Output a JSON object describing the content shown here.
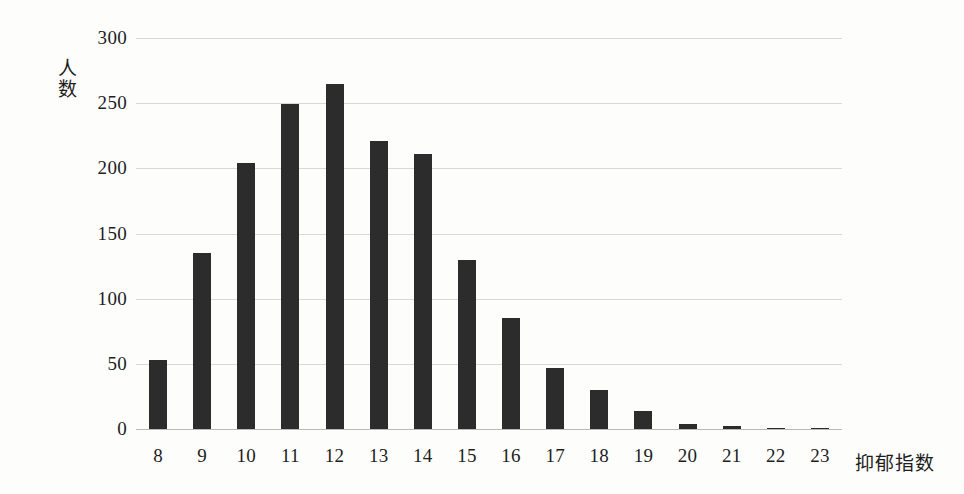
{
  "chart_data": {
    "type": "bar",
    "title": "",
    "subtitle": "",
    "xlabel": "抑郁指数",
    "ylabel": "人数",
    "categories": [
      "8",
      "9",
      "10",
      "11",
      "12",
      "13",
      "14",
      "15",
      "16",
      "17",
      "18",
      "19",
      "20",
      "21",
      "22",
      "23"
    ],
    "values": [
      53,
      135,
      204,
      249,
      265,
      221,
      211,
      130,
      85,
      47,
      30,
      14,
      4,
      2,
      1,
      1
    ],
    "series": [
      {
        "name": "人数",
        "values": [
          53,
          135,
          204,
          249,
          265,
          221,
          211,
          130,
          85,
          47,
          30,
          14,
          4,
          2,
          1,
          1
        ]
      }
    ],
    "ylim": [
      0,
      300
    ],
    "yticks": [
      0,
      50,
      100,
      150,
      200,
      250,
      300
    ],
    "ytick_labels": [
      "0",
      "50",
      "100",
      "150",
      "200",
      "250",
      "300"
    ],
    "grid": true,
    "grid_axis": "y",
    "legend": false,
    "legend_position": "none",
    "bar_color": "#2c2c2c",
    "grid_color": "#d8d8d8",
    "axis_color": "#b9b9b9",
    "background_color": "#fdfdfc",
    "text_color": "#1d1d1d"
  }
}
